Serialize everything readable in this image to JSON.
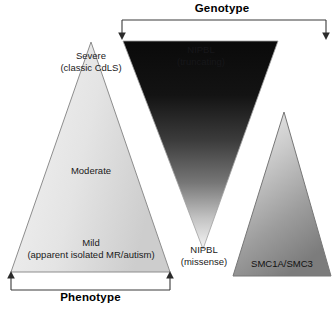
{
  "figure": {
    "title_top": "Genotype",
    "title_bottom": "Phenotype",
    "background_color": "#ffffff",
    "width": 334,
    "height": 311
  },
  "brackets": {
    "genotype": {
      "label": "Genotype",
      "orientation": "top",
      "arrow_direction": "down",
      "left_x": 122,
      "right_x": 326,
      "color": "#3a3a3a"
    },
    "phenotype": {
      "label": "Phenotype",
      "orientation": "bottom",
      "arrow_direction": "up",
      "left_x": 11,
      "right_x": 170,
      "color": "#3a3a3a"
    }
  },
  "shapes": [
    {
      "id": "phenotype-triangle",
      "name": "phenotype-severity-triangle",
      "orientation": "upright",
      "fill_from": "#f2f2f2",
      "fill_to": "#cfcfcf",
      "stroke": "#8a8a8a",
      "labels": [
        {
          "id": "severe",
          "line1": "Severe",
          "line2": "(classic CdLS)"
        },
        {
          "id": "moderate",
          "line1": "Moderate",
          "line2": ""
        },
        {
          "id": "mild",
          "line1": "Mild",
          "line2": "(apparent isolated MR/autism)"
        }
      ]
    },
    {
      "id": "nipbl-triangle",
      "name": "nipbl-genotype-triangle",
      "orientation": "inverted",
      "fill_from": "#0d0d0d",
      "fill_to": "#f4f4f4",
      "stroke": "#9a9a9a",
      "labels": [
        {
          "id": "nipbl-truncating",
          "line1": "NIPBL",
          "line2": "(truncating)"
        },
        {
          "id": "nipbl-missense",
          "line1": "NIPBL",
          "line2": "(missense)"
        }
      ]
    },
    {
      "id": "smc-triangle",
      "name": "smc1a-smc3-triangle",
      "orientation": "upright",
      "fill_from": "#efefef",
      "fill_to": "#7f7f7f",
      "stroke": "#7a7a7a",
      "labels": [
        {
          "id": "smc",
          "line1": "SMC1A/SMC3",
          "line2": ""
        }
      ]
    }
  ],
  "text": {
    "severe_l1": "Severe",
    "severe_l2": "(classic CdLS)",
    "moderate_l1": "Moderate",
    "mild_l1": "Mild",
    "mild_l2": "(apparent isolated MR/autism)",
    "nipbl_trunc_l1": "NIPBL",
    "nipbl_trunc_l2": "(truncating)",
    "nipbl_miss_l1": "NIPBL",
    "nipbl_miss_l2": "(missense)",
    "smc_l1": "SMC1A/SMC3"
  }
}
